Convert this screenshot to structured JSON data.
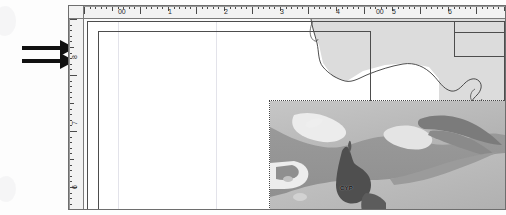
{
  "document": {
    "title": "Map layout",
    "page_label": "page"
  },
  "arrows": {
    "count": 2,
    "direction": "right",
    "color": "#111111",
    "purpose": "callout-arrow"
  },
  "horizontal_ruler": {
    "name": "horizontal-ruler",
    "unit": "inches",
    "labels": [
      "00",
      "1",
      "2",
      "3",
      "4",
      "00",
      "5",
      "6"
    ],
    "label_positions_px": [
      32,
      82,
      138,
      194,
      250,
      290,
      306,
      362
    ]
  },
  "vertical_ruler": {
    "name": "vertical-ruler",
    "unit": "inches",
    "labels": [
      "8",
      "7",
      "6"
    ],
    "label_positions_px": [
      30,
      96,
      160
    ]
  },
  "layers": {
    "vector_coastline": {
      "name": "coastline-layer",
      "style": "outline",
      "fill": "#dcdcdc",
      "stroke": "#3a3a3a"
    },
    "raster_relief": {
      "name": "relief-image-layer",
      "selected": true,
      "annotation_label": "CYP",
      "water_color": "#9a9a9a",
      "land_color": "#b8b8b8",
      "highland_color": "#7d7d7d"
    }
  },
  "frames": [
    {
      "name": "outer-data-frame"
    },
    {
      "name": "inner-data-frame"
    },
    {
      "name": "inset-frame"
    }
  ],
  "colors": {
    "ruler_bg": "#f2f2f2",
    "page_bg": "#ffffff",
    "canvas_bg": "#fbfbfb",
    "frame_stroke": "#4d4d4d",
    "window_stroke": "#6e6e6e"
  }
}
